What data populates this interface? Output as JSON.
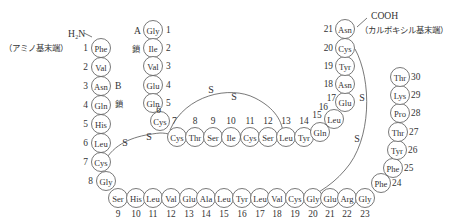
{
  "diagram": {
    "title_hidden": "Insulin primary structure (A chain, B chain, disulfide bonds)",
    "b_chain": {
      "label": "B",
      "label2": "鎖",
      "n_terminus": "H₂N",
      "n_terminus_note": "（アミノ基末端）",
      "residues": [
        "Phe",
        "Val",
        "Asn",
        "Gln",
        "His",
        "Leu",
        "Cys",
        "Gly",
        "Ser",
        "His",
        "Leu",
        "Val",
        "Glu",
        "Ala",
        "Leu",
        "Tyr",
        "Leu",
        "Val",
        "Cys",
        "Gly",
        "Glu",
        "Arg",
        "Gly",
        "Phe",
        "Phe",
        "Tyr",
        "Thr",
        "Pro",
        "Lys",
        "Thr"
      ],
      "numbers": [
        "1",
        "2",
        "3",
        "4",
        "5",
        "6",
        "7",
        "8",
        "9",
        "10",
        "11",
        "12",
        "13",
        "14",
        "15",
        "16",
        "17",
        "18",
        "19",
        "20",
        "21",
        "22",
        "23",
        "24",
        "25",
        "26",
        "27",
        "28",
        "29",
        "30"
      ]
    },
    "a_chain": {
      "label": "A",
      "label2": "鎖",
      "c_terminus": "COOH",
      "c_terminus_note": "（カルボキシル基末端）",
      "residues": [
        "Gly",
        "Ile",
        "Val",
        "Glu",
        "Gln",
        "Cys",
        "Cys",
        "Thr",
        "Ser",
        "Ile",
        "Cys",
        "Ser",
        "Leu",
        "Tyr",
        "Gln",
        "Leu",
        "Glu",
        "Asn",
        "Tyr",
        "Cys",
        "Asn"
      ],
      "numbers": [
        "1",
        "2",
        "3",
        "4",
        "5",
        "6",
        "7",
        "8",
        "9",
        "10",
        "11",
        "12",
        "13",
        "14",
        "15",
        "16",
        "17",
        "18",
        "19",
        "20",
        "21"
      ]
    },
    "disulfide_bonds": [
      {
        "from": "A6",
        "to": "A11",
        "atoms": [
          "S",
          "S"
        ]
      },
      {
        "from": "A7",
        "to": "B7",
        "atoms": [
          "S",
          "S"
        ]
      },
      {
        "from": "A20",
        "to": "B19",
        "atoms": [
          "S",
          "S"
        ]
      }
    ],
    "colors": {
      "stroke": "#555555",
      "text": "#333333",
      "background": "#ffffff"
    }
  }
}
